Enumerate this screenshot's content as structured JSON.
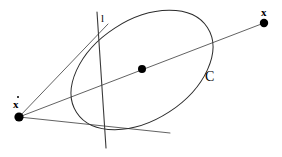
{
  "figure": {
    "kind": "projective-geometry-diagram",
    "background_color": "#ffffff",
    "stroke_color": "#3a3a3a",
    "conic_stroke_color": "#2b2b2b",
    "point_color": "#000000",
    "width": 282,
    "height": 157
  },
  "labels": {
    "point_x": "x",
    "point_x_dot": "x",
    "line_l": "l",
    "conic_c": "C"
  },
  "points": [
    {
      "name": "x",
      "label": "x",
      "cx": 264,
      "cy": 23,
      "r": 4.2
    },
    {
      "name": "x-dot",
      "label": "x",
      "cx": 19,
      "cy": 117,
      "r": 4.6
    },
    {
      "name": "conic-center",
      "label": "",
      "cx": 142,
      "cy": 69,
      "r": 4.0
    }
  ],
  "conic": {
    "name": "C",
    "type": "ellipse",
    "cx": 142,
    "cy": 70,
    "rx": 78,
    "ry": 50,
    "rotation_deg": -33
  },
  "line_l": {
    "name": "l",
    "x1": 97,
    "y1": 12,
    "x2": 106,
    "y2": 148
  },
  "rays": [
    {
      "name": "upper-tangent",
      "x1": 19,
      "y1": 117,
      "x2": 108,
      "y2": 24
    },
    {
      "name": "polar-through-center",
      "x1": 19,
      "y1": 117,
      "x2": 264,
      "y2": 23
    },
    {
      "name": "lower-tangent",
      "x1": 19,
      "y1": 117,
      "x2": 170,
      "y2": 133
    }
  ],
  "label_positions": {
    "x": {
      "left": 261,
      "top": 7
    },
    "x_dot": {
      "left": 13,
      "top": 99
    },
    "x_dot_accent": {
      "left": 17,
      "top": 96
    },
    "l": {
      "left": 101,
      "top": 13
    },
    "c": {
      "left": 205,
      "top": 70
    }
  }
}
